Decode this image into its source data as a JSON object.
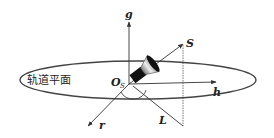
{
  "diagram": {
    "plane_label": "轨道平面",
    "origin_label": "O",
    "origin_subscript": "S",
    "axes": {
      "g": "g",
      "h": "h",
      "r": "r"
    },
    "points": {
      "S": "S",
      "L": "L"
    },
    "colors": {
      "line": "#333333",
      "ellipse": "#444444",
      "satellite": "#111111"
    }
  }
}
